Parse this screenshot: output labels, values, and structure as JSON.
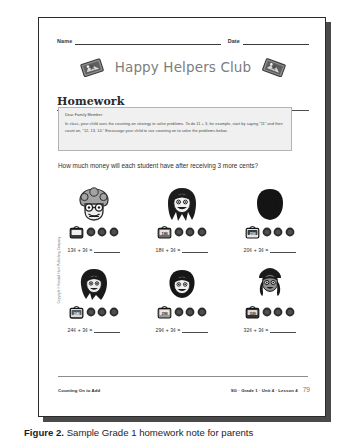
{
  "figure": {
    "caption_label": "Figure 2.",
    "caption_text": "Sample Grade 1 homework note for parents"
  },
  "page": {
    "copyright_notice": "Copyright © Kendall Hunt Publishing Company",
    "name_label": "Name",
    "date_label": "Date",
    "club_title": "Happy Helpers Club",
    "badge_left_icon": "sticker-badge-icon",
    "badge_right_icon": "sticker-badge-icon",
    "section_heading": "Homework"
  },
  "family_letter": {
    "salutation": "Dear Family Member:",
    "body": "In class, your child uses the counting-on strategy to solve problems. To do 11 + 3, for example, start by saying \"11\" and then count on, \"12, 13, 14.\" Encourage your child to use counting on to solve the problems below."
  },
  "prompt": {
    "text": "How much money will each student have after receiving 3 more cents?"
  },
  "problems": [
    {
      "student": "student-face-curly-glasses",
      "purse_amount": "13¢",
      "coin_count": 3,
      "equation": "13¢ + 3¢ =",
      "answer": ""
    },
    {
      "student": "student-face-long-dark-hair",
      "purse_amount": "18¢",
      "coin_count": 3,
      "equation": "18¢ + 3¢ =",
      "answer": ""
    },
    {
      "student": "student-face-short-dark-hair",
      "purse_amount": "20¢",
      "coin_count": 3,
      "equation": "20¢ + 3¢ =",
      "answer": ""
    },
    {
      "student": "student-face-wavy-hair",
      "purse_amount": "24¢",
      "coin_count": 3,
      "equation": "24¢ + 3¢ =",
      "answer": ""
    },
    {
      "student": "student-face-bob-hair",
      "purse_amount": "29¢",
      "coin_count": 3,
      "equation": "29¢ + 3¢ =",
      "answer": ""
    },
    {
      "student": "student-face-braids",
      "purse_amount": "32¢",
      "coin_count": 3,
      "equation": "32¢ + 3¢ =",
      "answer": ""
    }
  ],
  "footer": {
    "lesson_title": "Counting On to Add",
    "reference": "SG · Grade 1 · Unit 4 · Lesson 4",
    "page_number": "79"
  },
  "colors": {
    "page_background": "#ffffff",
    "page_border": "#2a2a2a",
    "page_shadow": "#4a4a4a",
    "club_title": "#7d7d7d",
    "letter_box_background": "#f0f0f0",
    "letter_box_border": "#b4b4b4",
    "body_text": "#2f2f2f",
    "footer_page_number": "#7b7b7b"
  }
}
